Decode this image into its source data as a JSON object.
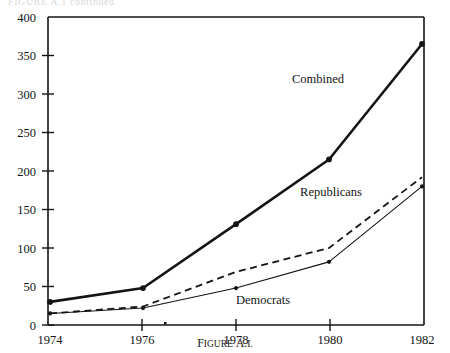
{
  "figure": {
    "caption_word1": "F",
    "caption_word1_rest": "IGURE",
    "caption_word2": "A.",
    "caption_word2_rest": "I",
    "caption_full": "FIGURE A.1.",
    "clipped_header_text": "FIGURE A.1 continued",
    "background_color": "#ffffff",
    "ink_color": "#141414"
  },
  "chart_data": {
    "type": "line",
    "title": "",
    "subtitle": "",
    "xlabel": "",
    "ylabel": "",
    "x": [
      1974,
      1976,
      1978,
      1980,
      1982
    ],
    "categories": [
      "1974",
      "1976",
      "1978",
      "1980",
      "1982"
    ],
    "xlim": [
      1974,
      1982
    ],
    "ylim": [
      0,
      400
    ],
    "ytick_values": [
      0,
      50,
      100,
      150,
      200,
      250,
      300,
      350,
      400
    ],
    "ytick_labels": [
      "0",
      "50",
      "100",
      "150",
      "200",
      "250",
      "300",
      "350",
      "400"
    ],
    "xtick_labels": [
      "1974",
      "1976",
      "1978",
      "1980",
      "1982"
    ],
    "grid": false,
    "legend": "inline-annotations",
    "series": [
      {
        "name": "Combined",
        "label": "Combined",
        "style": "solid-thick",
        "color": "#141414",
        "line_width": 2.6,
        "markers": true,
        "values": [
          30,
          48,
          131,
          215,
          365
        ],
        "label_x": 1979.05,
        "label_y": 318
      },
      {
        "name": "Republicans",
        "label": "Republicans",
        "style": "dashed",
        "color": "#141414",
        "line_width": 1.8,
        "markers": false,
        "values": [
          15,
          24,
          69,
          100,
          192
        ],
        "label_x": 1979.3,
        "label_y": 182
      },
      {
        "name": "Democrats",
        "label": "Democrats",
        "style": "solid-thin",
        "color": "#141414",
        "line_width": 1.1,
        "markers": true,
        "values": [
          15,
          22,
          48,
          82,
          180
        ],
        "label_x": 1977.5,
        "label_y": 28
      }
    ]
  }
}
